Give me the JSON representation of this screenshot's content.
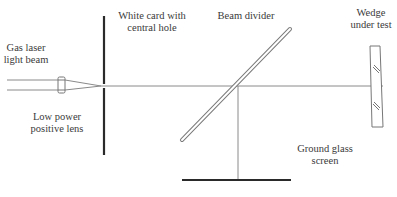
{
  "diagram": {
    "type": "optical-setup",
    "colors": {
      "line": "#777777",
      "thick": "#2a2a2a",
      "text": "#3a3a3a"
    },
    "labels": {
      "laser": [
        "Gas laser",
        "light beam"
      ],
      "lens": [
        "Low power",
        "positive lens"
      ],
      "card": [
        "White card with",
        "central hole"
      ],
      "divider": [
        "Beam divider"
      ],
      "wedge": [
        "Wedge",
        "under test"
      ],
      "screen": [
        "Ground glass",
        "screen"
      ]
    },
    "components": [
      {
        "name": "gas-laser-beam",
        "label_ref": "laser"
      },
      {
        "name": "low-power-positive-lens",
        "label_ref": "lens"
      },
      {
        "name": "white-card-with-central-hole",
        "label_ref": "card"
      },
      {
        "name": "beam-divider",
        "label_ref": "divider"
      },
      {
        "name": "wedge-under-test",
        "label_ref": "wedge"
      },
      {
        "name": "ground-glass-screen",
        "label_ref": "screen"
      }
    ]
  }
}
